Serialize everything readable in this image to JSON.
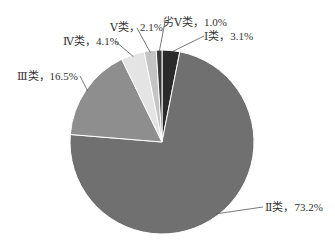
{
  "chart_data": {
    "type": "pie",
    "title": "",
    "categories": [
      "Ⅰ类",
      "Ⅱ类",
      "Ⅲ类",
      "Ⅳ类",
      "Ⅴ类",
      "劣Ⅴ类"
    ],
    "values": [
      3.1,
      73.2,
      16.5,
      4.1,
      2.1,
      1.0
    ],
    "unit": "%",
    "colors": [
      "#2b2b2b",
      "#707070",
      "#8e8e8e",
      "#e4e4e4",
      "#c4c4c4",
      "#3a3a3a"
    ],
    "start_angle_deg": 0,
    "direction": "clockwise",
    "legend": "none",
    "data_labels": [
      "Ⅰ类，3.1%",
      "Ⅱ类，73.2%",
      "Ⅲ类，16.5%",
      "Ⅳ类，4.1%",
      "Ⅴ类，2.1%",
      "劣Ⅴ类，1.0%"
    ]
  },
  "labels": {
    "c1": "Ⅰ类，3.1%",
    "c2": "Ⅱ类，73.2%",
    "c3": "Ⅲ类，16.5%",
    "c4": "Ⅳ类，4.1%",
    "c5": "Ⅴ类，2.1%",
    "c6": "劣Ⅴ类，1.0%"
  }
}
